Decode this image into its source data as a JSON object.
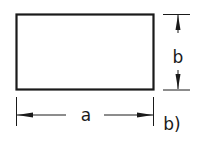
{
  "diagram": {
    "shape": "rectangle",
    "dimensions": {
      "width_label": "a",
      "height_label": "b"
    },
    "subfigure_label": "b)",
    "colors": {
      "stroke": "#1a1a1a",
      "background": "#ffffff"
    }
  }
}
